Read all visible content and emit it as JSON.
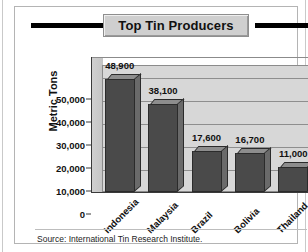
{
  "figure": {
    "title": "Top Tin Producers",
    "source_note": "Source: International Tin Research Institute."
  },
  "chart_data": {
    "type": "bar",
    "title": "Top Tin Producers",
    "categories": [
      "Indonesia",
      "Malaysia",
      "Brazil",
      "Bolivia",
      "Thailand"
    ],
    "values": [
      48900,
      38100,
      17600,
      16700,
      11000
    ],
    "value_labels": [
      "48,900",
      "38,100",
      "17,600",
      "16,700",
      "11,000"
    ],
    "xlabel": "",
    "ylabel": "Metric Tons",
    "ylim": [
      0,
      55000
    ],
    "yticks": [
      0,
      10000,
      20000,
      30000,
      40000,
      50000
    ],
    "ytick_labels": [
      "0",
      "10,000",
      "20,000",
      "30,000",
      "40,000",
      "50,000"
    ],
    "grid": true,
    "grid_axis": "y",
    "legend": false,
    "legend_position": "none",
    "style_3d": true,
    "colors": {
      "bar_front": "#4a4a4a",
      "bar_top": "#8d8d8d",
      "bar_side": "#6a6a6a",
      "plot_background": "#d7d7d7",
      "gridline": "#8e8e8e",
      "title_band": "#cfcfcf",
      "panel_background": "#ffffff",
      "text": "#111111"
    }
  }
}
